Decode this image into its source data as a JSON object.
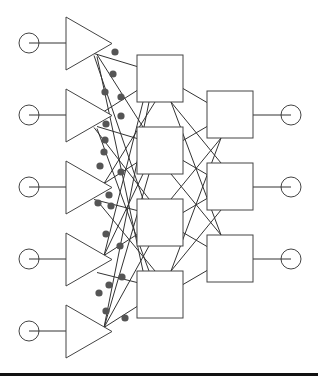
{
  "diagram": {
    "type": "neural-network-schematic",
    "colors": {
      "line": "#333333",
      "dot": "#555555",
      "background": "#ffffff",
      "rule": "#111111"
    },
    "inputs": [
      {
        "cx": 29,
        "cy": 43
      },
      {
        "cx": 29,
        "cy": 115
      },
      {
        "cx": 29,
        "cy": 187
      },
      {
        "cx": 29,
        "cy": 259
      },
      {
        "cx": 29,
        "cy": 331
      }
    ],
    "amplifiers": [
      {
        "left": 66,
        "top": 17,
        "bottom": 70,
        "tip": 112
      },
      {
        "left": 66,
        "top": 89,
        "bottom": 142,
        "tip": 112
      },
      {
        "left": 66,
        "top": 161,
        "bottom": 214,
        "tip": 112
      },
      {
        "left": 66,
        "top": 233,
        "bottom": 286,
        "tip": 112
      },
      {
        "left": 66,
        "top": 305,
        "bottom": 358,
        "tip": 112
      }
    ],
    "hidden_nodes": [
      {
        "x": 137,
        "y": 55,
        "w": 46,
        "h": 47
      },
      {
        "x": 137,
        "y": 127,
        "w": 46,
        "h": 47
      },
      {
        "x": 137,
        "y": 199,
        "w": 46,
        "h": 47
      },
      {
        "x": 137,
        "y": 271,
        "w": 46,
        "h": 47
      }
    ],
    "output_nodes": [
      {
        "x": 207,
        "y": 91,
        "w": 46,
        "h": 47
      },
      {
        "x": 207,
        "y": 163,
        "w": 46,
        "h": 47
      },
      {
        "x": 207,
        "y": 235,
        "w": 46,
        "h": 47
      }
    ],
    "outputs": [
      {
        "cx": 291,
        "cy": 115
      },
      {
        "cx": 291,
        "cy": 187
      },
      {
        "cx": 291,
        "cy": 259
      }
    ],
    "weight_dots": [
      [
        115,
        52
      ],
      [
        113,
        74
      ],
      [
        105,
        92
      ],
      [
        121,
        97
      ],
      [
        121,
        116
      ],
      [
        106,
        124
      ],
      [
        105,
        140
      ],
      [
        104,
        152
      ],
      [
        100,
        166
      ],
      [
        121,
        172
      ],
      [
        109,
        195
      ],
      [
        98,
        203
      ],
      [
        111,
        206
      ],
      [
        106,
        234
      ],
      [
        120,
        246
      ],
      [
        122,
        277
      ],
      [
        109,
        285
      ],
      [
        99,
        293
      ],
      [
        106,
        311
      ],
      [
        125,
        318
      ]
    ],
    "counts": {
      "inputs": 5,
      "hidden": 4,
      "outputs": 3
    }
  }
}
